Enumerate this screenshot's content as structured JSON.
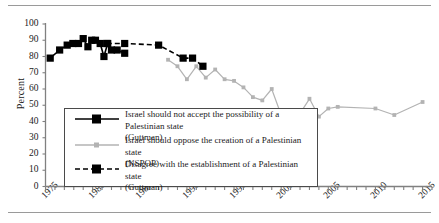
{
  "chart_data": {
    "type": "line",
    "title": "",
    "xlabel": "",
    "ylabel": "Percent",
    "xlim": [
      1975,
      2016
    ],
    "ylim": [
      0,
      100
    ],
    "y_ticks": [
      0,
      10,
      20,
      30,
      40,
      50,
      60,
      70,
      80,
      90,
      100
    ],
    "x_ticks_labeled": [
      1975,
      1980,
      1985,
      1990,
      1995,
      2000,
      2005,
      2010,
      2015
    ],
    "x_minor_tick_interval": 1,
    "grid": false,
    "legend_position": "inside-lower-left",
    "series": [
      {
        "name": "Israel should not accept the possibility of a Palestinian state (Guttman)",
        "legend_line1": "Israel should not accept the possibility of a Palestinian state",
        "legend_line2": "(Guttman)",
        "style": "solid",
        "color": "#000000",
        "marker": "square",
        "points": [
          {
            "x": 1975.5,
            "y": 79
          },
          {
            "x": 1976.5,
            "y": 84
          },
          {
            "x": 1977.3,
            "y": 87
          },
          {
            "x": 1977.9,
            "y": 88
          },
          {
            "x": 1978.5,
            "y": 88
          },
          {
            "x": 1979.0,
            "y": 91
          },
          {
            "x": 1979.5,
            "y": 86
          },
          {
            "x": 1979.9,
            "y": 90
          },
          {
            "x": 1980.3,
            "y": 90
          },
          {
            "x": 1980.8,
            "y": 88
          },
          {
            "x": 1981.2,
            "y": 80
          },
          {
            "x": 1981.6,
            "y": 88
          },
          {
            "x": 1982.0,
            "y": 84
          },
          {
            "x": 1982.6,
            "y": 84
          },
          {
            "x": 1983.4,
            "y": 82
          }
        ]
      },
      {
        "name": "Israel should oppose the creation of a Palestinian state (NSPOP)",
        "legend_line1": "Israel should oppose the creation of a Palestinian state",
        "legend_line2": "(NSPOP)",
        "style": "solid",
        "color": "#b3b3b3",
        "marker": "square-small",
        "points": [
          {
            "x": 1988,
            "y": 78
          },
          {
            "x": 1989,
            "y": 74
          },
          {
            "x": 1990,
            "y": 66
          },
          {
            "x": 1991,
            "y": 74
          },
          {
            "x": 1992,
            "y": 67
          },
          {
            "x": 1993,
            "y": 72
          },
          {
            "x": 1994,
            "y": 66
          },
          {
            "x": 1995,
            "y": 65
          },
          {
            "x": 1996,
            "y": 61
          },
          {
            "x": 1997,
            "y": 55
          },
          {
            "x": 1998,
            "y": 53
          },
          {
            "x": 1999,
            "y": 60
          },
          {
            "x": 2000,
            "y": 44
          },
          {
            "x": 2001,
            "y": 45
          },
          {
            "x": 2002,
            "y": 45
          },
          {
            "x": 2003,
            "y": 54
          },
          {
            "x": 2004,
            "y": 43
          },
          {
            "x": 2005,
            "y": 48
          },
          {
            "x": 2006,
            "y": 49
          },
          {
            "x": 2010,
            "y": 48
          },
          {
            "x": 2012,
            "y": 44
          },
          {
            "x": 2015,
            "y": 52
          }
        ]
      },
      {
        "name": "Disagree with the establishment of a Palestinian state (Guttman)",
        "legend_line1": "Disagree with the establishment of a Palestinian state",
        "legend_line2": "(Guttman)",
        "style": "dashed",
        "color": "#000000",
        "marker": "square",
        "points": [
          {
            "x": 1981.5,
            "y": 88
          },
          {
            "x": 1983.4,
            "y": 88
          },
          {
            "x": 1987.0,
            "y": 87
          },
          {
            "x": 1989.6,
            "y": 79
          },
          {
            "x": 1990.6,
            "y": 79
          },
          {
            "x": 1991.7,
            "y": 74
          }
        ]
      }
    ]
  },
  "axis": {
    "y_title": "Percent",
    "y_labels": [
      "100",
      "90",
      "80",
      "70",
      "60",
      "50",
      "40",
      "30",
      "20",
      "10",
      "0"
    ],
    "x_labels": [
      "1975",
      "1980",
      "1985",
      "1990",
      "1995",
      "2000",
      "2005",
      "2010",
      "2015"
    ]
  },
  "colors": {
    "series_black": "#000000",
    "series_gray": "#b3b3b3",
    "axis": "#808080",
    "rule": "#9a9a9a"
  }
}
